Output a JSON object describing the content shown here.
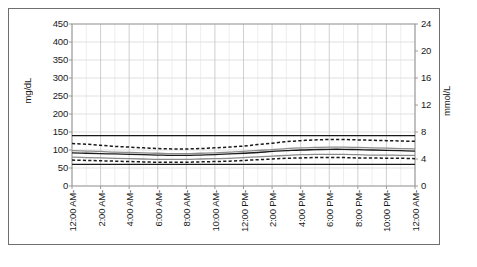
{
  "axes": {
    "left_title": "mg/dL",
    "right_title": "mmol/L",
    "left_ticks": [
      "0",
      "50",
      "100",
      "150",
      "200",
      "250",
      "300",
      "350",
      "400",
      "450"
    ],
    "right_ticks": [
      "0",
      "4",
      "8",
      "12",
      "16",
      "20",
      "24"
    ],
    "x_ticks": [
      "12:00 AM-",
      "2:00 AM-",
      "4:00 AM-",
      "6:00 AM-",
      "8:00 AM-",
      "10:00 AM-",
      "12:00 PM-",
      "2:00 PM-",
      "4:00 PM-",
      "6:00 PM-",
      "8:00 PM-",
      "10:00 PM-",
      "12:00 AM-"
    ]
  },
  "style": {
    "grid_color": "#d4d4d4",
    "axis_color": "#9a9a9a",
    "line_dark": "#1a1a1a",
    "line_grey": "#8c8c8c",
    "frame_color": "#6f6f6f"
  },
  "chart_data": {
    "type": "line",
    "title": "",
    "xlabel": "",
    "ylabel": "mg/dL",
    "ylabel_right": "mmol/L",
    "ylim": [
      0,
      450
    ],
    "ylim_right": [
      0,
      24
    ],
    "grid": true,
    "legend": "none",
    "x": [
      "12:00 AM",
      "1:00 AM",
      "2:00 AM",
      "3:00 AM",
      "4:00 AM",
      "5:00 AM",
      "6:00 AM",
      "7:00 AM",
      "8:00 AM",
      "9:00 AM",
      "10:00 AM",
      "11:00 AM",
      "12:00 PM",
      "1:00 PM",
      "2:00 PM",
      "3:00 PM",
      "4:00 PM",
      "5:00 PM",
      "6:00 PM",
      "7:00 PM",
      "8:00 PM",
      "9:00 PM",
      "10:00 PM",
      "11:00 PM",
      "12:00 AM"
    ],
    "series": [
      {
        "name": "upper-limit",
        "style": "solid",
        "color": "#1a1a1a",
        "values": [
          140,
          140,
          140,
          140,
          140,
          140,
          140,
          140,
          140,
          140,
          140,
          140,
          140,
          140,
          140,
          140,
          140,
          140,
          140,
          140,
          140,
          140,
          140,
          140,
          140
        ]
      },
      {
        "name": "upper-percentile",
        "style": "dashed",
        "color": "#1a1a1a",
        "values": [
          118,
          116,
          113,
          110,
          108,
          106,
          104,
          103,
          103,
          104,
          106,
          108,
          111,
          115,
          119,
          123,
          126,
          128,
          129,
          129,
          128,
          127,
          126,
          125,
          124
        ]
      },
      {
        "name": "median-upper",
        "style": "solid",
        "color": "#8c8c8c",
        "values": [
          98,
          97,
          96,
          94,
          93,
          92,
          91,
          90,
          90,
          91,
          92,
          94,
          96,
          99,
          101,
          104,
          106,
          107,
          108,
          108,
          107,
          106,
          105,
          104,
          103
        ]
      },
      {
        "name": "mean",
        "style": "solid",
        "color": "#1a1a1a",
        "values": [
          92,
          91,
          90,
          89,
          88,
          87,
          86,
          85,
          85,
          86,
          87,
          89,
          91,
          93,
          96,
          98,
          100,
          101,
          102,
          102,
          101,
          100,
          99,
          98,
          97
        ]
      },
      {
        "name": "median-lower",
        "style": "solid",
        "color": "#8c8c8c",
        "values": [
          80,
          79,
          78,
          77,
          76,
          75,
          74,
          74,
          74,
          75,
          76,
          77,
          79,
          81,
          83,
          85,
          87,
          88,
          88,
          88,
          87,
          86,
          86,
          85,
          85
        ]
      },
      {
        "name": "lower-percentile",
        "style": "dashed",
        "color": "#1a1a1a",
        "values": [
          72,
          71,
          70,
          69,
          68,
          67,
          66,
          66,
          66,
          67,
          68,
          69,
          71,
          73,
          75,
          77,
          78,
          79,
          79,
          79,
          78,
          78,
          77,
          77,
          76
        ]
      },
      {
        "name": "lower-limit",
        "style": "solid",
        "color": "#1a1a1a",
        "values": [
          60,
          60,
          60,
          60,
          60,
          60,
          60,
          60,
          60,
          60,
          60,
          60,
          60,
          60,
          60,
          60,
          60,
          60,
          60,
          60,
          60,
          60,
          60,
          60,
          60
        ]
      }
    ]
  }
}
